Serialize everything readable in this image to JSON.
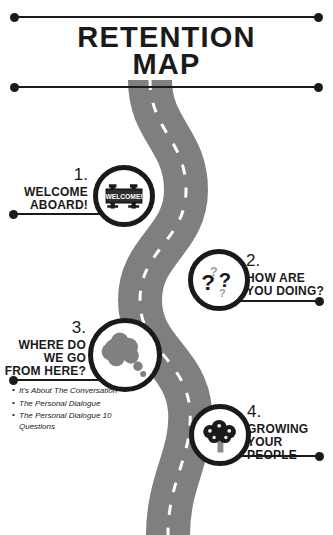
{
  "title": {
    "line1": "RETENTION",
    "line2": "MAP"
  },
  "colors": {
    "ink": "#1a1a1a",
    "road": "#7f7f7f",
    "road_line": "#ffffff",
    "icon_gray": "#808080",
    "background": "#ffffff"
  },
  "rules": [
    {
      "name": "top-rule"
    },
    {
      "name": "mid-rule"
    }
  ],
  "road": {
    "name": "winding-road",
    "dash_color": "#ffffff",
    "surface_color": "#7f7f7f"
  },
  "steps": [
    {
      "number": "1.",
      "label_lines": [
        "WELCOME",
        "ABOARD!"
      ],
      "icon": "welcome-sign-icon",
      "side": "left",
      "sign_text": "WELCOME!"
    },
    {
      "number": "2.",
      "label_lines": [
        "HOW ARE",
        "YOU DOING?"
      ],
      "icon": "question-marks-icon",
      "side": "right",
      "marks": [
        "?",
        "?",
        "?",
        "?"
      ]
    },
    {
      "number": "3.",
      "label_lines": [
        "WHERE DO",
        "WE GO",
        "FROM HERE?"
      ],
      "icon": "thought-bubble-icon",
      "side": "left"
    },
    {
      "number": "4.",
      "label_lines": [
        "GROWING",
        "YOUR",
        "PEOPLE"
      ],
      "icon": "tree-icon",
      "side": "right"
    }
  ],
  "bullets": [
    "It's About The Conversation",
    "The Personal Dialogue",
    "The Personal Dialogue 10 Questions"
  ]
}
